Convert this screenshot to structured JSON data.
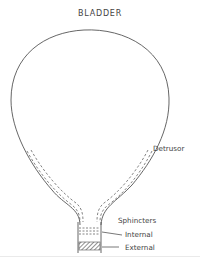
{
  "diagram": {
    "title": "BLADDER",
    "labels": {
      "detrusor": "Detrusor",
      "sphincters": "Sphincters",
      "internal": "Internal",
      "external": "External"
    },
    "colors": {
      "outline": "#555555",
      "text": "#444444"
    }
  }
}
